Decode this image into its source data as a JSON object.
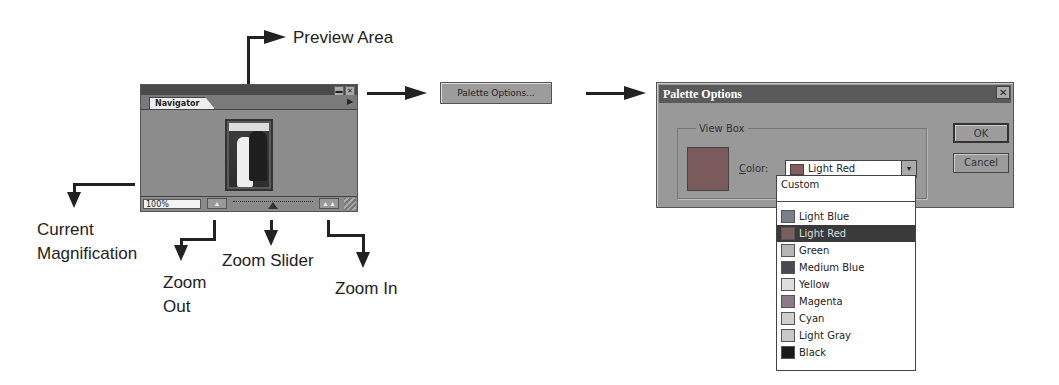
{
  "callouts": {
    "preview_area": "Preview Area",
    "current_magnification_1": "Current",
    "current_magnification_2": "Magnification",
    "zoom_out_1": "Zoom",
    "zoom_out_2": "Out",
    "zoom_slider": "Zoom Slider",
    "zoom_in": "Zoom In"
  },
  "navigator": {
    "tab_label": "Navigator",
    "magnification": "100%",
    "minimize_icon": "▬",
    "close_icon": "✕",
    "menu_icon": "▶",
    "zoom_out_icon": "▲",
    "zoom_in_icon": "▲▲"
  },
  "palette_options_button": {
    "label": "Palette Options..."
  },
  "dialog": {
    "title": "Palette Options",
    "close_icon": "✕",
    "group_label": "View Box",
    "color_label_accel": "C",
    "color_label_rest": "olor:",
    "selected_color": "Light Red",
    "dropdown_icon": "▼",
    "ok_label": "OK",
    "cancel_label": "Cancel",
    "selected_swatch": "#8a5d5d"
  },
  "dropdown": {
    "custom": "Custom",
    "items": [
      {
        "label": "Light Blue",
        "color": "#7a7f8a",
        "selected": false
      },
      {
        "label": "Light Red",
        "color": "#7a5f5f",
        "selected": true
      },
      {
        "label": "Green",
        "color": "#b5b5b5",
        "selected": false
      },
      {
        "label": "Medium Blue",
        "color": "#4a4a55",
        "selected": false
      },
      {
        "label": "Yellow",
        "color": "#dedede",
        "selected": false
      },
      {
        "label": "Magenta",
        "color": "#8a7a8a",
        "selected": false
      },
      {
        "label": "Cyan",
        "color": "#cfcfcf",
        "selected": false
      },
      {
        "label": "Light Gray",
        "color": "#c8c8c8",
        "selected": false
      },
      {
        "label": "Black",
        "color": "#1a1a1a",
        "selected": false
      }
    ]
  }
}
